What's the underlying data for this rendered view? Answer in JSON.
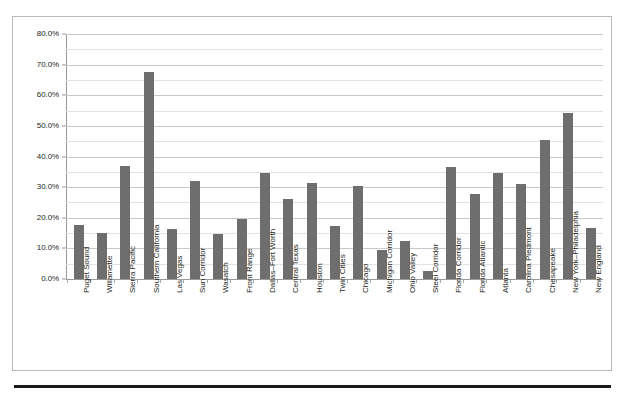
{
  "chart_data": {
    "type": "bar",
    "title": "",
    "subtitle": "",
    "xlabel": "",
    "ylabel": "",
    "ylim": [
      0,
      80
    ],
    "y_unit": "%",
    "grid": true,
    "legend": "none",
    "orientation": "vertical",
    "bar_color": "#6e6e6e",
    "gridline_color": "#c8c8c8",
    "axis_color": "#9a9a9a",
    "frame_color": "#b9b9b9",
    "y_ticks": [
      "0.0%",
      "10.0%",
      "20.0%",
      "30.0%",
      "40.0%",
      "50.0%",
      "60.0%",
      "70.0%",
      "80.0%"
    ],
    "y_tick_values": [
      0,
      10,
      20,
      30,
      40,
      50,
      60,
      70,
      80
    ],
    "minor_tick_values": [
      5,
      15,
      25,
      35,
      45,
      55,
      65,
      75
    ],
    "categories": [
      "Puget Sound",
      "Willamette",
      "Sierra Pacific",
      "Southern California",
      "Las Vegas",
      "Sun Corridor",
      "Wasatch",
      "Front Range",
      "Dallas–Fort Worth",
      "Central Texas",
      "Houston",
      "Twin Cities",
      "Chicago",
      "Michigan Corridor",
      "Ohio Valley",
      "Steel Corridor",
      "Florida Corridor",
      "Florida Atlantic",
      "Atlanta",
      "Carolina Piedmont",
      "Chesapeake",
      "New York–Philadelphia",
      "New England"
    ],
    "values": [
      17.5,
      15.0,
      36.8,
      67.5,
      16.3,
      32.0,
      14.8,
      19.5,
      34.5,
      26.0,
      31.3,
      17.3,
      30.3,
      9.5,
      12.5,
      2.5,
      36.5,
      27.8,
      34.5,
      31.0,
      45.3,
      54.3,
      16.8
    ]
  }
}
